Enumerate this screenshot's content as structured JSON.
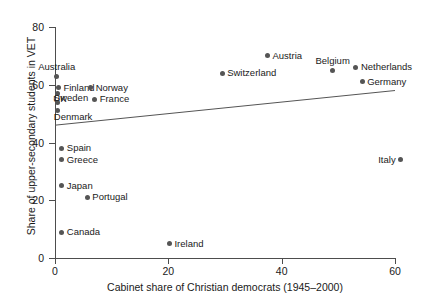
{
  "chart_data": {
    "type": "scatter",
    "title": "",
    "xlabel": "Cabinet share of Christian democrats (1945–2000)",
    "ylabel": "Share of upper-secondary students in VET",
    "xlim": [
      -2,
      62
    ],
    "ylim": [
      -2,
      82
    ],
    "xticks": [
      0,
      20,
      40,
      60
    ],
    "yticks": [
      0,
      20,
      40,
      60,
      80
    ],
    "xtick_labels": [
      "0",
      "20",
      "40",
      "60"
    ],
    "ytick_labels": [
      "0",
      "20",
      "40",
      "60",
      "80"
    ],
    "grid": false,
    "legend": "none",
    "points": [
      {
        "label": "Australia",
        "x": 0.3,
        "y": 63,
        "label_pos": "above"
      },
      {
        "label": "Finland",
        "x": 0.6,
        "y": 59,
        "label_pos": "right"
      },
      {
        "label": "UK",
        "x": 0.4,
        "y": 57,
        "label_pos": "below-right"
      },
      {
        "label": "Sweden",
        "x": 0.5,
        "y": 54,
        "label_pos": "above-right"
      },
      {
        "label": "Denmark",
        "x": 0.5,
        "y": 51,
        "label_pos": "below-right"
      },
      {
        "label": "Norway",
        "x": 6.3,
        "y": 59,
        "label_pos": "right"
      },
      {
        "label": "France",
        "x": 7.0,
        "y": 55,
        "label_pos": "right"
      },
      {
        "label": "Spain",
        "x": 1.2,
        "y": 38,
        "label_pos": "right"
      },
      {
        "label": "Greece",
        "x": 1.2,
        "y": 34,
        "label_pos": "right"
      },
      {
        "label": "Japan",
        "x": 1.2,
        "y": 25,
        "label_pos": "right"
      },
      {
        "label": "Portugal",
        "x": 5.7,
        "y": 21,
        "label_pos": "right"
      },
      {
        "label": "Canada",
        "x": 1.2,
        "y": 9,
        "label_pos": "right"
      },
      {
        "label": "Ireland",
        "x": 20.2,
        "y": 5,
        "label_pos": "right"
      },
      {
        "label": "Switzerland",
        "x": 29.5,
        "y": 64,
        "label_pos": "right"
      },
      {
        "label": "Austria",
        "x": 37.5,
        "y": 70,
        "label_pos": "right"
      },
      {
        "label": "Belgium",
        "x": 49.0,
        "y": 65,
        "label_pos": "above"
      },
      {
        "label": "Netherlands",
        "x": 53.1,
        "y": 66,
        "label_pos": "right"
      },
      {
        "label": "Germany",
        "x": 54.2,
        "y": 61,
        "label_pos": "right"
      },
      {
        "label": "Italy",
        "x": 61.0,
        "y": 34,
        "label_pos": "left"
      }
    ],
    "fit_line": {
      "type": "linear",
      "x_start": 0,
      "y_start": 46,
      "x_end": 60,
      "y_end": 58,
      "color": "#555555"
    },
    "marker_color": "#555555",
    "axis_color": "#4d4d4d",
    "background": "#ffffff"
  }
}
